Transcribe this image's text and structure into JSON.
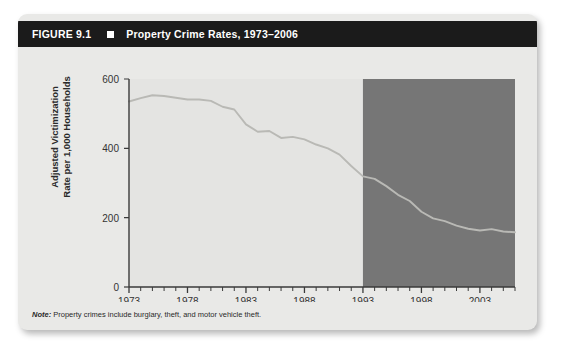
{
  "figure": {
    "number": "FIGURE 9.1",
    "bullet_icon": "square-bullet-icon",
    "title": "Property Crime Rates, 1973–2006",
    "note_label": "Note:",
    "note_text": " Property crimes include burglary, theft, and motor vehicle theft."
  },
  "colors": {
    "title_bar": "#1b1b1b",
    "card_background": "#e9e9e7",
    "plot_background": "#e4e4e2",
    "shade_band": "#767676",
    "line": "#b9b9b5",
    "axis": "#3a3a3a",
    "text": "#2a2a2a"
  },
  "chart_data": {
    "type": "line",
    "title": "Property Crime Rates, 1973–2006",
    "xlabel": "",
    "ylabel": "Adjusted Victimization Rate per 1,000 Households",
    "ylabel_line1": "Adjusted Victimization",
    "ylabel_line2": "Rate per 1,000 Households",
    "xlim": [
      1973,
      2006
    ],
    "ylim": [
      0,
      600
    ],
    "ytick_values": [
      0,
      200,
      400,
      600
    ],
    "ytick_labels": [
      "0",
      "200",
      "400",
      "600"
    ],
    "xtick_values": [
      1973,
      1978,
      1983,
      1988,
      1993,
      1998,
      2003
    ],
    "xtick_labels": [
      "1973",
      "1978",
      "1983",
      "1988",
      "1993",
      "1998",
      "2003"
    ],
    "minor_xticks_every": 1,
    "grid": false,
    "legend": null,
    "annotations": [
      {
        "name": "shaded-band",
        "type": "vspan",
        "x_start": 1993,
        "x_end": 2006,
        "color": "#767676",
        "label": ""
      }
    ],
    "series": [
      {
        "name": "Adjusted property crime victimization rate",
        "color": "#b9b9b5",
        "x": [
          1973,
          1974,
          1975,
          1976,
          1977,
          1978,
          1979,
          1980,
          1981,
          1982,
          1983,
          1984,
          1985,
          1986,
          1987,
          1988,
          1989,
          1990,
          1991,
          1992,
          1993,
          1994,
          1995,
          1996,
          1997,
          1998,
          1999,
          2000,
          2001,
          2002,
          2003,
          2004,
          2005,
          2006
        ],
        "values": [
          535,
          545,
          553,
          551,
          546,
          541,
          541,
          537,
          520,
          512,
          469,
          448,
          450,
          430,
          433,
          426,
          411,
          400,
          382,
          349,
          319,
          312,
          291,
          266,
          248,
          217,
          198,
          190,
          177,
          168,
          163,
          167,
          160,
          158
        ]
      }
    ]
  }
}
